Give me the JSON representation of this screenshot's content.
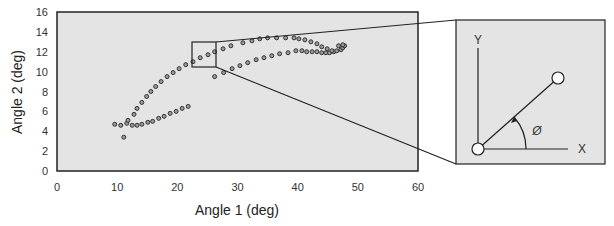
{
  "chart_data": {
    "type": "scatter",
    "title": "",
    "xlabel": "Angle 1 (deg)",
    "ylabel": "Angle 2 (deg)",
    "xlim": [
      0,
      60
    ],
    "ylim": [
      0,
      16
    ],
    "xticks": [
      0,
      10,
      20,
      30,
      40,
      50,
      60
    ],
    "yticks": [
      0,
      2,
      4,
      6,
      8,
      10,
      12,
      14,
      16
    ],
    "grid": false,
    "legend": null,
    "background": "#e4e4e4",
    "marker": "open-circle",
    "series": [
      {
        "name": "trajectory",
        "points": [
          [
            11.1,
            3.4
          ],
          [
            9.6,
            4.7
          ],
          [
            10.6,
            4.6
          ],
          [
            11.6,
            4.8
          ],
          [
            12.5,
            4.6
          ],
          [
            13.3,
            4.6
          ],
          [
            14.1,
            4.7
          ],
          [
            15.1,
            4.9
          ],
          [
            15.9,
            5.0
          ],
          [
            16.9,
            5.3
          ],
          [
            17.8,
            5.5
          ],
          [
            18.8,
            5.8
          ],
          [
            19.8,
            6.0
          ],
          [
            20.8,
            6.3
          ],
          [
            21.8,
            6.5
          ],
          [
            26.2,
            9.5
          ],
          [
            27.7,
            9.9
          ],
          [
            29.1,
            10.3
          ],
          [
            30.4,
            10.6
          ],
          [
            31.7,
            10.9
          ],
          [
            33.1,
            11.2
          ],
          [
            34.4,
            11.4
          ],
          [
            35.7,
            11.6
          ],
          [
            37.0,
            11.8
          ],
          [
            38.4,
            11.9
          ],
          [
            39.7,
            12.1
          ],
          [
            40.7,
            12.1
          ],
          [
            41.5,
            12.0
          ],
          [
            42.4,
            12.0
          ],
          [
            43.2,
            12.0
          ],
          [
            44.0,
            11.9
          ],
          [
            44.7,
            11.9
          ],
          [
            45.3,
            11.9
          ],
          [
            46.0,
            12.0
          ],
          [
            11.8,
            5.1
          ],
          [
            12.8,
            5.7
          ],
          [
            13.3,
            6.3
          ],
          [
            14.1,
            6.9
          ],
          [
            14.9,
            7.5
          ],
          [
            15.6,
            8.0
          ],
          [
            16.4,
            8.5
          ],
          [
            17.3,
            9.0
          ],
          [
            18.3,
            9.5
          ],
          [
            19.3,
            9.9
          ],
          [
            20.3,
            10.3
          ],
          [
            21.4,
            10.7
          ],
          [
            22.6,
            11.0
          ],
          [
            23.8,
            11.4
          ],
          [
            25.1,
            11.7
          ],
          [
            26.2,
            12.0
          ],
          [
            27.6,
            12.3
          ],
          [
            28.9,
            12.6
          ],
          [
            30.9,
            12.9
          ],
          [
            32.4,
            13.1
          ],
          [
            33.7,
            13.3
          ],
          [
            35.0,
            13.4
          ],
          [
            36.5,
            13.4
          ],
          [
            38.0,
            13.4
          ],
          [
            39.4,
            13.4
          ],
          [
            40.2,
            13.3
          ],
          [
            41.2,
            13.2
          ],
          [
            42.2,
            13.0
          ],
          [
            43.2,
            12.8
          ],
          [
            44.0,
            12.5
          ],
          [
            44.9,
            12.3
          ],
          [
            45.7,
            12.1
          ],
          [
            46.5,
            12.1
          ],
          [
            47.2,
            12.2
          ],
          [
            47.5,
            12.4
          ],
          [
            47.8,
            12.6
          ],
          [
            47.5,
            12.7
          ],
          [
            46.8,
            12.6
          ]
        ]
      }
    ],
    "annotations": [
      {
        "type": "zoom-box",
        "x_range": [
          22.5,
          26.5
        ],
        "y_range": [
          10.4,
          12.9
        ]
      },
      {
        "type": "inset-diagram",
        "labels": [
          "Y",
          "X",
          "Ø"
        ],
        "description": "Vector from origin at angle Ø from X axis"
      }
    ]
  },
  "axes": {
    "x_label": "Angle 1 (deg)",
    "y_label": "Angle 2 (deg)",
    "x_ticks": [
      "0",
      "10",
      "20",
      "30",
      "40",
      "50",
      "60"
    ],
    "y_ticks": [
      "0",
      "2",
      "4",
      "6",
      "8",
      "10",
      "12",
      "14",
      "16"
    ]
  },
  "inset": {
    "y_axis_label": "Y",
    "x_axis_label": "X",
    "angle_label": "Ø"
  },
  "colors": {
    "plot_bg": "#e4e4e4",
    "frame": "#222222",
    "marker": "#333333"
  }
}
